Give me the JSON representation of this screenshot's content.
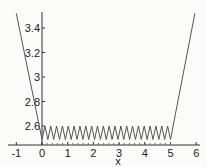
{
  "chart_data": {
    "type": "line",
    "title": "",
    "xlabel": "x",
    "ylabel": "",
    "xlim": [
      -1,
      6
    ],
    "ylim": [
      2.445,
      3.53
    ],
    "x_ticks": [
      "-1",
      "0",
      "1",
      "2",
      "3",
      "4",
      "5",
      "6"
    ],
    "y_ticks": [
      "2.6",
      "2.8",
      "3",
      "3.2",
      "3.4"
    ],
    "grid": false,
    "legend": null,
    "series": [
      {
        "name": "f(x)",
        "description": "Steep linear descent from x=-1 to x=0, sawtooth oscillation between about 2.49 and 2.6 for x in [0,5] (~22 peaks), steep linear rise from x=5 to x=6",
        "points": [
          [
            -1.0,
            3.52
          ],
          [
            0.0,
            2.5
          ],
          [
            0.11,
            2.6
          ],
          [
            0.22,
            2.49
          ],
          [
            5.0,
            2.5
          ],
          [
            5.95,
            3.52
          ]
        ],
        "oscillation": {
          "x_range": [
            0,
            5
          ],
          "y_min": 2.49,
          "y_max": 2.6,
          "peaks": 22
        }
      }
    ]
  },
  "axis": {
    "x_label": "x",
    "x_ticks": [
      "-1",
      "0",
      "1",
      "2",
      "3",
      "4",
      "5",
      "6"
    ],
    "y_ticks": [
      "2.6",
      "2.8",
      "3",
      "3.2",
      "3.4"
    ]
  }
}
